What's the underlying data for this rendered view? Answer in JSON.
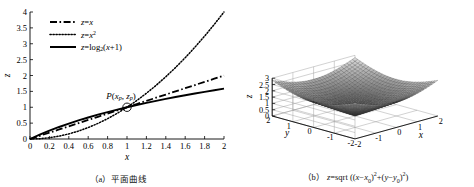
{
  "figure": {
    "panels": [
      {
        "id": "a",
        "caption_tag": "（a）",
        "caption_text": "平面曲线",
        "axes": {
          "xlabel": "x",
          "ylabel": "z",
          "xlim": [
            0,
            2
          ],
          "ylim": [
            0,
            4
          ],
          "xticks": [
            "0",
            "0.2",
            "0.4",
            "0.6",
            "0.8",
            "1",
            "1.2",
            "1.4",
            "1.6",
            "1.8",
            "2"
          ],
          "xtickvals": [
            0,
            0.2,
            0.4,
            0.6,
            0.8,
            1,
            1.2,
            1.4,
            1.6,
            1.8,
            2
          ],
          "yticks": [
            "0",
            "0.5",
            "1",
            "1.5",
            "2",
            "2.5",
            "3",
            "3.5",
            "4"
          ],
          "ytickvals": [
            0,
            0.5,
            1,
            1.5,
            2,
            2.5,
            3,
            3.5,
            4
          ],
          "grid": false
        },
        "legend": {
          "position": "top-left",
          "entries": [
            {
              "label": "z=x",
              "style": "dashdot",
              "color": "#000000"
            },
            {
              "label": "z=x²",
              "style": "dotted",
              "color": "#000000"
            },
            {
              "label": "z=log₂(x+1)",
              "style": "solid",
              "color": "#000000"
            }
          ]
        },
        "annotations": [
          {
            "name": "point-P",
            "label": "P(xp, zp)",
            "x": 1,
            "y": 1,
            "marker": "circle"
          }
        ]
      },
      {
        "id": "b",
        "caption_tag": "（b）",
        "caption_text": "z=sqrt((x−x0)²+(y−y0)²)",
        "axes": {
          "xlabel": "x",
          "ylabel": "y",
          "zlabel": "z",
          "xlim": [
            -2,
            2
          ],
          "ylim": [
            -2,
            2
          ],
          "zlim": [
            0,
            3
          ],
          "xticks": [
            "-2",
            "-1",
            "0",
            "1",
            "2"
          ],
          "yticks": [
            "2",
            "1",
            "0",
            "-1",
            "-2"
          ],
          "zticks": [
            "0",
            "0.5",
            "1",
            "1.5",
            "2",
            "2.5",
            "3"
          ],
          "ztickvals": [
            0,
            0.5,
            1,
            1.5,
            2,
            2.5,
            3
          ],
          "grid": true
        }
      }
    ]
  },
  "chart_data": [
    {
      "type": "line",
      "title": "（a）平面曲线",
      "xlabel": "x",
      "ylabel": "z",
      "xlim": [
        0,
        2
      ],
      "ylim": [
        0,
        4
      ],
      "grid": false,
      "legend_position": "upper-left",
      "x": [
        0,
        0.1,
        0.2,
        0.3,
        0.4,
        0.5,
        0.6,
        0.7,
        0.8,
        0.9,
        1,
        1.1,
        1.2,
        1.3,
        1.4,
        1.5,
        1.6,
        1.7,
        1.8,
        1.9,
        2
      ],
      "series": [
        {
          "name": "z=x",
          "style": "dashdot",
          "values": [
            0,
            0.1,
            0.2,
            0.3,
            0.4,
            0.5,
            0.6,
            0.7,
            0.8,
            0.9,
            1,
            1.1,
            1.2,
            1.3,
            1.4,
            1.5,
            1.6,
            1.7,
            1.8,
            1.9,
            2
          ]
        },
        {
          "name": "z=x²",
          "style": "dotted",
          "values": [
            0,
            0.01,
            0.04,
            0.09,
            0.16,
            0.25,
            0.36,
            0.49,
            0.64,
            0.81,
            1,
            1.21,
            1.44,
            1.69,
            1.96,
            2.25,
            2.56,
            2.89,
            3.24,
            3.61,
            4
          ]
        },
        {
          "name": "z=log₂(x+1)",
          "style": "solid",
          "values": [
            0,
            0.1375,
            0.263,
            0.3785,
            0.4854,
            0.585,
            0.6781,
            0.7655,
            0.848,
            0.926,
            1,
            1.0704,
            1.1375,
            1.2016,
            1.263,
            1.3219,
            1.3785,
            1.433,
            1.4854,
            1.536,
            1.585
          ]
        }
      ],
      "annotations": [
        {
          "text": "P(xp, zp)",
          "x": 1,
          "y": 1
        }
      ]
    },
    {
      "type": "surface",
      "title": "（b）z=sqrt((x−x0)²+(y−y0)²)",
      "xlabel": "x",
      "ylabel": "y",
      "zlabel": "z",
      "xlim": [
        -2,
        2
      ],
      "ylim": [
        -2,
        2
      ],
      "zlim": [
        0,
        3
      ],
      "grid": true,
      "function": "z = sqrt((x-x0)^2 + (y-y0)^2)",
      "x0": 0,
      "y0": 0,
      "mesh_n": 30,
      "colormap": "gray"
    }
  ]
}
